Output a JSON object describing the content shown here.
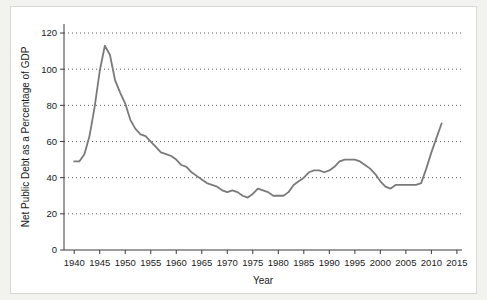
{
  "chart_data": {
    "type": "line",
    "title": "",
    "xlabel": "Year",
    "ylabel": "Net Public Debt as a Percentage of GDP",
    "xlim": [
      1938,
      2016
    ],
    "ylim": [
      0,
      125
    ],
    "xticks": [
      1940,
      1945,
      1950,
      1955,
      1960,
      1965,
      1970,
      1975,
      1980,
      1985,
      1990,
      1995,
      2000,
      2005,
      2010,
      2015
    ],
    "yticks": [
      0,
      20,
      40,
      60,
      80,
      100,
      120
    ],
    "grid": "horizontal-dotted",
    "legend": "none",
    "line_color": "#7a7a7a",
    "background_color": "#ffffff",
    "page_background_color": "#f2f2ef",
    "series": [
      {
        "name": "Net Public Debt as a Percentage of GDP",
        "x": [
          1940,
          1941,
          1942,
          1943,
          1944,
          1945,
          1946,
          1947,
          1948,
          1949,
          1950,
          1951,
          1952,
          1953,
          1954,
          1955,
          1956,
          1957,
          1958,
          1959,
          1960,
          1961,
          1962,
          1963,
          1964,
          1965,
          1966,
          1967,
          1968,
          1969,
          1970,
          1971,
          1972,
          1973,
          1974,
          1975,
          1976,
          1977,
          1978,
          1979,
          1980,
          1981,
          1982,
          1983,
          1984,
          1985,
          1986,
          1987,
          1988,
          1989,
          1990,
          1991,
          1992,
          1993,
          1994,
          1995,
          1996,
          1997,
          1998,
          1999,
          2000,
          2001,
          2002,
          2003,
          2004,
          2005,
          2006,
          2007,
          2008,
          2009,
          2010,
          2011,
          2012
        ],
        "values": [
          49,
          49,
          53,
          63,
          79,
          99,
          113,
          108,
          94,
          87,
          81,
          72,
          67,
          64,
          63,
          60,
          57,
          54,
          53,
          52,
          50,
          47,
          46,
          43,
          41,
          39,
          37,
          36,
          35,
          33,
          32,
          33,
          32,
          30,
          29,
          31,
          34,
          33,
          32,
          30,
          30,
          30,
          32,
          36,
          38,
          40,
          43,
          44,
          44,
          43,
          44,
          46,
          49,
          50,
          50,
          50,
          49,
          47,
          45,
          42,
          38,
          35,
          34,
          36,
          36,
          36,
          36,
          36,
          37,
          45,
          54,
          62,
          70
        ]
      }
    ]
  }
}
